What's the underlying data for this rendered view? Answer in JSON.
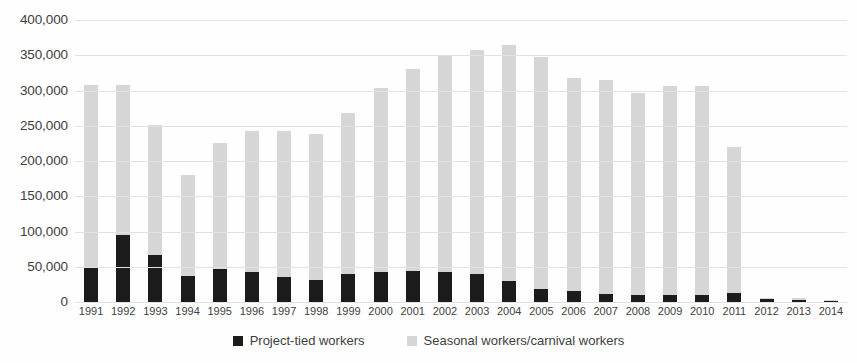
{
  "chart_data": {
    "type": "bar",
    "stacked": true,
    "title": "",
    "subtitle": "",
    "xlabel": "",
    "ylabel": "",
    "ylim": [
      0,
      400000
    ],
    "yticks": [
      0,
      50000,
      100000,
      150000,
      200000,
      250000,
      300000,
      350000,
      400000
    ],
    "ytick_labels": [
      "0",
      "50,000",
      "100,000",
      "150,000",
      "200,000",
      "250,000",
      "300,000",
      "350,000",
      "400,000"
    ],
    "grid": true,
    "legend_position": "bottom",
    "categories": [
      "1991",
      "1992",
      "1993",
      "1994",
      "1995",
      "1996",
      "1997",
      "1998",
      "1999",
      "2000",
      "2001",
      "2002",
      "2003",
      "2004",
      "2005",
      "2006",
      "2007",
      "2008",
      "2009",
      "2010",
      "2011",
      "2012",
      "2013",
      "2014"
    ],
    "series": [
      {
        "name": "Project-tied workers",
        "color": "#1c1c1c",
        "values": [
          50000,
          95000,
          67000,
          37000,
          47000,
          43000,
          36000,
          31000,
          40000,
          42000,
          44000,
          42000,
          40000,
          30000,
          18000,
          15000,
          12000,
          10000,
          10000,
          10000,
          13000,
          4000,
          3000,
          2000
        ]
      },
      {
        "name": "Seasonal workers/carnival workers",
        "color": "#d6d6d6",
        "values": [
          258000,
          213000,
          184000,
          143000,
          178000,
          199000,
          206000,
          208000,
          228000,
          262000,
          286000,
          307000,
          318000,
          335000,
          330000,
          303000,
          303000,
          286000,
          296000,
          296000,
          207000,
          2000,
          2000,
          1000
        ]
      }
    ],
    "totals": [
      308000,
      308000,
      251000,
      180000,
      225000,
      242000,
      242000,
      239000,
      268000,
      304000,
      330000,
      349000,
      358000,
      365000,
      348000,
      318000,
      315000,
      296000,
      306000,
      306000,
      220000,
      6000,
      5000,
      3000
    ]
  },
  "legend": {
    "items": [
      {
        "label": "Project-tied workers",
        "swatch": "black-square-marker"
      },
      {
        "label": "Seasonal workers/carnival workers",
        "swatch": "gray-square-marker"
      }
    ]
  },
  "colors": {
    "project_tied": "#1c1c1c",
    "seasonal": "#d6d6d6",
    "gridline": "#e2e2e2",
    "text": "#3f3f3f",
    "background": "#fefefe"
  }
}
